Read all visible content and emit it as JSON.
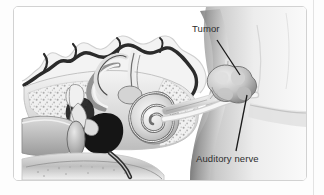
{
  "figure": {
    "kind": "medical-illustration",
    "style": "grayscale anatomical drawing",
    "labels": [
      {
        "id": "tumor",
        "text": "Tumor"
      },
      {
        "id": "auditory_nerve",
        "text": "Auditory nerve"
      }
    ],
    "colors": {
      "page_background": "#fdfdfd",
      "card_background": "#ffffff",
      "card_border": "#d2d2d2",
      "panel_edge": "#e3e3e3",
      "label_text": "#2d2d2d",
      "leader_line": "#1a1a1a",
      "bone_outline": "#2b2b2b",
      "tissue_light": "#e9e9e9",
      "tissue_mid": "#b4b4b4",
      "tissue_dark": "#5a5a5a",
      "cavity_black": "#151515"
    }
  }
}
